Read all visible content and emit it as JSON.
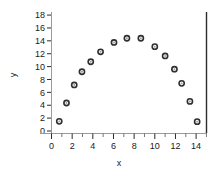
{
  "chart_data": {
    "type": "scatter",
    "title": "",
    "subtitle": "",
    "xlabel": "x",
    "ylabel": "y",
    "xlim": [
      -0.9,
      15.2
    ],
    "ylim": [
      -0.6,
      18.8
    ],
    "grid": false,
    "legend": null,
    "legend_position": "none",
    "x_major_ticks": [
      0,
      2,
      4,
      6,
      8,
      10,
      12,
      14
    ],
    "x_major_tick_labels": [
      "0",
      "2",
      "4",
      "6",
      "8",
      "10",
      "12",
      "14"
    ],
    "x_minor_ticks": [
      1,
      3,
      5,
      7,
      9,
      11,
      13,
      15
    ],
    "y_major_ticks": [
      0,
      2,
      4,
      6,
      8,
      10,
      12,
      14,
      16,
      18
    ],
    "y_major_tick_labels": [
      "0",
      "2",
      "4",
      "6",
      "8",
      "10",
      "12",
      "14",
      "16",
      "18"
    ],
    "marker": "open-circle",
    "marker_color": "#2f2f2f",
    "points": [
      {
        "x": 0.75,
        "y": 1.5
      },
      {
        "x": 1.45,
        "y": 4.35
      },
      {
        "x": 2.2,
        "y": 7.15
      },
      {
        "x": 2.95,
        "y": 9.2
      },
      {
        "x": 3.8,
        "y": 10.75
      },
      {
        "x": 4.75,
        "y": 12.3
      },
      {
        "x": 6.05,
        "y": 13.75
      },
      {
        "x": 7.3,
        "y": 14.4
      },
      {
        "x": 8.65,
        "y": 14.4
      },
      {
        "x": 10.0,
        "y": 13.1
      },
      {
        "x": 11.0,
        "y": 11.65
      },
      {
        "x": 11.9,
        "y": 9.6
      },
      {
        "x": 12.6,
        "y": 7.4
      },
      {
        "x": 13.4,
        "y": 4.6
      },
      {
        "x": 14.1,
        "y": 1.45
      }
    ],
    "series": [
      {
        "name": "data",
        "x": [
          0.75,
          1.45,
          2.2,
          2.95,
          3.8,
          4.75,
          6.05,
          7.3,
          8.65,
          10.0,
          11.0,
          11.9,
          12.6,
          13.4,
          14.1
        ],
        "y": [
          1.5,
          4.35,
          7.15,
          9.2,
          10.75,
          12.3,
          13.75,
          14.4,
          14.4,
          13.1,
          11.65,
          9.6,
          7.4,
          4.6,
          1.45
        ]
      }
    ]
  },
  "colors": {
    "background": "#ffffff",
    "marker": "#2f2f2f",
    "axis_left": "#9a9a9a",
    "axis_right": "#2b2b2b",
    "text": "#1a1a1a"
  }
}
